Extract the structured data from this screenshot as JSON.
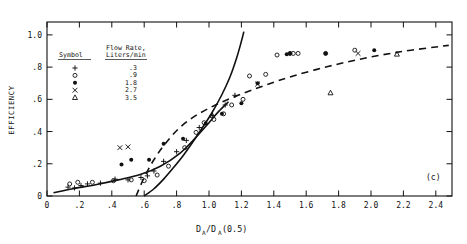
{
  "figure": {
    "panel_label": "(c)",
    "xlabel_main": "D",
    "xlabel_sub1": "A",
    "xlabel_mid": "/D",
    "xlabel_sub2": "A",
    "xlabel_tail": "(0.5)",
    "ylabel": "EFFICIENCY"
  },
  "legend": {
    "header_symbol": "Symbol",
    "header_rate_line1": "Flow Rate,",
    "header_rate_line2": "Liters/min",
    "rows": [
      {
        "symbol": "+",
        "glyph": "plus",
        "value": ".3"
      },
      {
        "symbol": "o",
        "glyph": "open-circle",
        "value": ".9"
      },
      {
        "symbol": "●",
        "glyph": "filled-circle",
        "value": "1.8"
      },
      {
        "symbol": "×",
        "glyph": "cross",
        "value": "2.7"
      },
      {
        "symbol": "△",
        "glyph": "open-triangle",
        "value": "3.5"
      }
    ]
  },
  "chart_data": {
    "type": "scatter",
    "title": "",
    "xlabel": "D_A/D_A(0.5)",
    "ylabel": "EFFICIENCY",
    "xlim": [
      0,
      2.5
    ],
    "ylim": [
      0,
      1.08
    ],
    "grid": false,
    "legend_position": "upper-left-inset",
    "xticks": [
      0,
      0.2,
      0.4,
      0.6,
      0.8,
      1.0,
      1.2,
      1.4,
      1.6,
      1.8,
      2.0,
      2.2,
      2.4
    ],
    "xticklabels": [
      "0",
      ".2",
      ".4",
      ".6",
      ".8",
      "1.0",
      "1.2",
      "1.4",
      "1.6",
      "1.8",
      "2.0",
      "2.2",
      "2.4"
    ],
    "yticks": [
      0,
      0.2,
      0.4,
      0.6,
      0.8,
      1.0
    ],
    "yticklabels": [
      "0",
      ".2",
      ".4",
      ".6",
      ".8",
      "1.0"
    ],
    "series": [
      {
        "name": ".3",
        "marker": "plus",
        "points": [
          [
            0.13,
            0.055
          ],
          [
            0.17,
            0.05
          ],
          [
            0.21,
            0.065
          ],
          [
            0.25,
            0.075
          ],
          [
            0.33,
            0.08
          ],
          [
            0.42,
            0.105
          ],
          [
            0.5,
            0.1
          ],
          [
            0.58,
            0.115
          ],
          [
            0.62,
            0.125
          ],
          [
            0.66,
            0.155
          ],
          [
            0.72,
            0.215
          ],
          [
            0.8,
            0.275
          ],
          [
            0.86,
            0.345
          ],
          [
            0.94,
            0.425
          ],
          [
            1.02,
            0.5
          ],
          [
            1.1,
            0.565
          ],
          [
            1.16,
            0.625
          ]
        ]
      },
      {
        "name": ".9",
        "marker": "open-circle",
        "points": [
          [
            0.14,
            0.075
          ],
          [
            0.19,
            0.085
          ],
          [
            0.28,
            0.085
          ],
          [
            0.41,
            0.095
          ],
          [
            0.52,
            0.1
          ],
          [
            0.6,
            0.095
          ],
          [
            0.68,
            0.13
          ],
          [
            0.75,
            0.185
          ],
          [
            0.85,
            0.3
          ],
          [
            0.92,
            0.395
          ],
          [
            0.97,
            0.455
          ],
          [
            1.03,
            0.475
          ],
          [
            1.09,
            0.51
          ],
          [
            1.14,
            0.565
          ],
          [
            1.21,
            0.6
          ],
          [
            1.25,
            0.745
          ],
          [
            1.35,
            0.755
          ],
          [
            1.42,
            0.875
          ],
          [
            1.5,
            0.885
          ],
          [
            1.52,
            0.885
          ],
          [
            1.55,
            0.885
          ],
          [
            1.72,
            0.885
          ],
          [
            1.9,
            0.905
          ]
        ]
      },
      {
        "name": "1.8",
        "marker": "filled-circle",
        "points": [
          [
            0.46,
            0.195
          ],
          [
            0.52,
            0.225
          ],
          [
            0.63,
            0.225
          ],
          [
            0.72,
            0.325
          ],
          [
            0.84,
            0.355
          ],
          [
            0.98,
            0.45
          ],
          [
            1.08,
            0.51
          ],
          [
            1.2,
            0.575
          ],
          [
            1.3,
            0.7
          ],
          [
            1.48,
            0.88
          ],
          [
            1.5,
            0.885
          ],
          [
            1.72,
            0.885
          ],
          [
            2.02,
            0.905
          ]
        ]
      },
      {
        "name": "2.7",
        "marker": "cross",
        "points": [
          [
            0.45,
            0.3
          ],
          [
            0.5,
            0.305
          ],
          [
            1.3,
            0.695
          ],
          [
            1.92,
            0.885
          ]
        ]
      },
      {
        "name": "3.5",
        "marker": "open-triangle",
        "points": [
          [
            1.02,
            0.5
          ],
          [
            1.75,
            0.64
          ],
          [
            2.16,
            0.88
          ]
        ]
      }
    ],
    "curves": [
      {
        "name": "solid-curve",
        "style": "solid",
        "points": [
          [
            0.6,
            0.0
          ],
          [
            0.66,
            0.045
          ],
          [
            0.72,
            0.105
          ],
          [
            0.78,
            0.175
          ],
          [
            0.84,
            0.25
          ],
          [
            0.9,
            0.335
          ],
          [
            0.96,
            0.425
          ],
          [
            1.02,
            0.52
          ],
          [
            1.08,
            0.63
          ],
          [
            1.13,
            0.74
          ],
          [
            1.17,
            0.855
          ],
          [
            1.2,
            0.96
          ],
          [
            1.215,
            1.02
          ]
        ]
      },
      {
        "name": "dashed-curve",
        "style": "dashed",
        "points": [
          [
            0.55,
            0.0
          ],
          [
            0.6,
            0.115
          ],
          [
            0.66,
            0.225
          ],
          [
            0.73,
            0.325
          ],
          [
            0.82,
            0.425
          ],
          [
            0.92,
            0.5
          ],
          [
            1.04,
            0.565
          ],
          [
            1.18,
            0.625
          ],
          [
            1.34,
            0.685
          ],
          [
            1.52,
            0.745
          ],
          [
            1.74,
            0.805
          ],
          [
            1.96,
            0.855
          ],
          [
            2.18,
            0.895
          ],
          [
            2.4,
            0.925
          ],
          [
            2.48,
            0.935
          ]
        ]
      },
      {
        "name": "lower-solid-trend",
        "style": "solid",
        "points": [
          [
            0.04,
            0.02
          ],
          [
            0.16,
            0.045
          ],
          [
            0.3,
            0.07
          ],
          [
            0.44,
            0.1
          ],
          [
            0.58,
            0.135
          ],
          [
            0.7,
            0.185
          ],
          [
            0.82,
            0.265
          ],
          [
            0.92,
            0.365
          ],
          [
            1.0,
            0.455
          ],
          [
            1.06,
            0.525
          ],
          [
            1.12,
            0.585
          ]
        ]
      }
    ]
  }
}
